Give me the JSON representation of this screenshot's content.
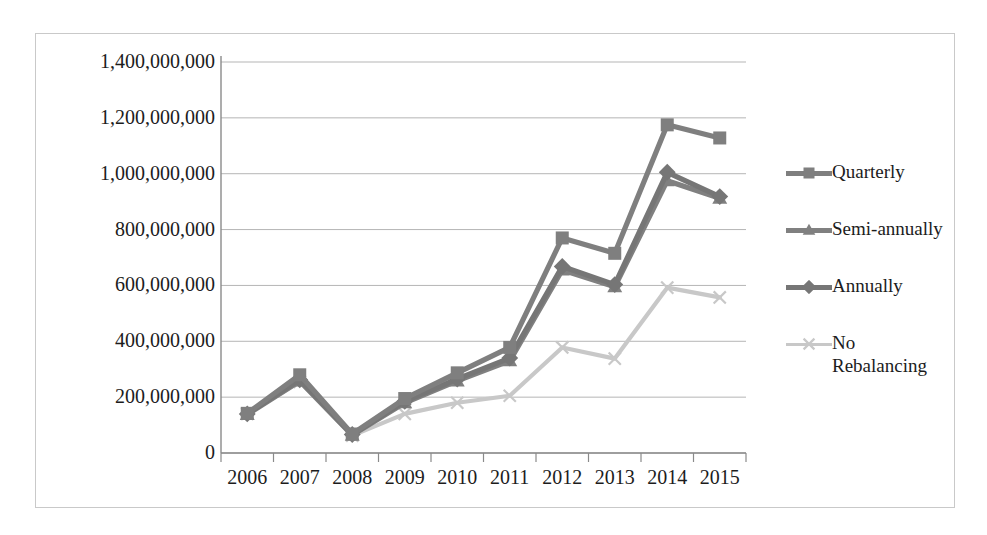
{
  "chart_data": {
    "type": "line",
    "title": "",
    "subtitle": "",
    "xlabel": "",
    "ylabel": "",
    "categories": [
      "2006",
      "2007",
      "2008",
      "2009",
      "2010",
      "2011",
      "2012",
      "2013",
      "2014",
      "2015"
    ],
    "ylim": [
      0,
      1400000000
    ],
    "ytick_step": 200000000,
    "yticks": [
      0,
      200000000,
      400000000,
      600000000,
      800000000,
      1000000000,
      1200000000,
      1400000000
    ],
    "ytick_labels": [
      "0",
      "200,000,000",
      "400,000,000",
      "600,000,000",
      "800,000,000",
      "1,000,000,000",
      "1,200,000,000",
      "1,400,000,000"
    ],
    "grid": true,
    "grid_axis": "y",
    "legend_position": "right",
    "series": [
      {
        "name": "Quarterly",
        "marker": "square",
        "color": "#7f7f7f",
        "values": [
          142000000,
          280000000,
          68000000,
          195000000,
          287000000,
          378000000,
          770000000,
          715000000,
          1175000000,
          1128000000
        ]
      },
      {
        "name": "Semi-annually",
        "marker": "triangle",
        "color": "#808080",
        "values": [
          138000000,
          258000000,
          64000000,
          180000000,
          258000000,
          330000000,
          655000000,
          595000000,
          975000000,
          912000000
        ]
      },
      {
        "name": "Annually",
        "marker": "diamond",
        "color": "#767676",
        "values": [
          140000000,
          262000000,
          66000000,
          185000000,
          265000000,
          340000000,
          668000000,
          603000000,
          1005000000,
          918000000
        ]
      },
      {
        "name": "No Rebalancing",
        "marker": "x",
        "color": "#c8c8c8",
        "values": [
          140000000,
          255000000,
          62000000,
          140000000,
          180000000,
          205000000,
          378000000,
          338000000,
          592000000,
          557000000
        ]
      }
    ]
  },
  "legend": {
    "items": [
      {
        "label": "Quarterly"
      },
      {
        "label": "Semi-annually"
      },
      {
        "label": "Annually"
      },
      {
        "label": "No\nRebalancing"
      }
    ]
  },
  "colors": {
    "series_dark": "#7f7f7f",
    "series_light": "#c8c8c8",
    "gridline": "#b5b5b5",
    "axis": "#8a8a8a",
    "frame": "#c9c9c9",
    "text": "#1c1c1c",
    "background": "#ffffff"
  }
}
